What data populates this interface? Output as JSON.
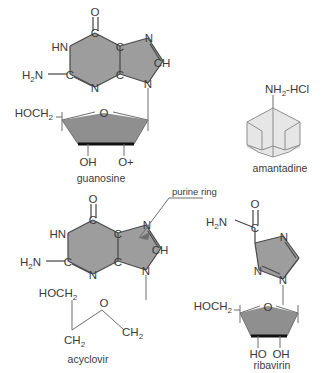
{
  "figure": {
    "background_color": "#ffffff",
    "ring_fill_color": "#9d9d9d",
    "sugar_fill_color": "#8f8f8f",
    "cage_fill_color": "#e6e6e6",
    "bond_color": "#4a4a4a",
    "text_color": "#3a3a3a"
  },
  "annotations": {
    "purine_ring": "purine ring"
  },
  "structures": {
    "guanosine": {
      "caption": "guanosine",
      "labels": {
        "carbonyl_o": "O",
        "hn": "HN",
        "c6": "C",
        "c5": "C",
        "n7": "N",
        "ch8": "CH",
        "amino": "H",
        "amino_sub": "2",
        "amino_n": "N",
        "c2": "C",
        "n3": "N",
        "c4": "C",
        "n9": "N",
        "hydroxymethyl": "HOCH",
        "hydroxymethyl_sub": "2",
        "ring_o": "O",
        "oh_left": "OH",
        "o_plus": "O+"
      }
    },
    "amantadine": {
      "caption": "amantadine",
      "labels": {
        "amine": "NH",
        "amine_sub": "2",
        "salt": "-HCl"
      }
    },
    "acyclovir": {
      "caption": "acyclovir",
      "labels": {
        "carbonyl_o": "O",
        "hn": "HN",
        "c6": "C",
        "c5": "C",
        "n7": "N",
        "ch8": "CH",
        "amino": "H",
        "amino_sub": "2",
        "amino_n": "N",
        "c2": "C",
        "n3": "N",
        "c4": "C",
        "n9": "N",
        "hydroxymethyl": "HOCH",
        "hydroxymethyl_sub": "2",
        "chain_ch2_left": "CH",
        "chain_ch2_left_sub": "2",
        "chain_o": "O",
        "chain_ch2_right": "CH",
        "chain_ch2_right_sub": "2"
      }
    },
    "ribavirin": {
      "caption": "ribavirin",
      "labels": {
        "amide_h2n": "H",
        "amide_h2n_sub": "2",
        "amide_n": "N",
        "amide_c": "C",
        "amide_o": "O",
        "n_top": "N",
        "n_left": "N",
        "n_bottom": "N",
        "hydroxymethyl": "HOCH",
        "hydroxymethyl_sub": "2",
        "ring_o": "O",
        "ho_left": "HO",
        "oh_right": "OH"
      }
    }
  }
}
